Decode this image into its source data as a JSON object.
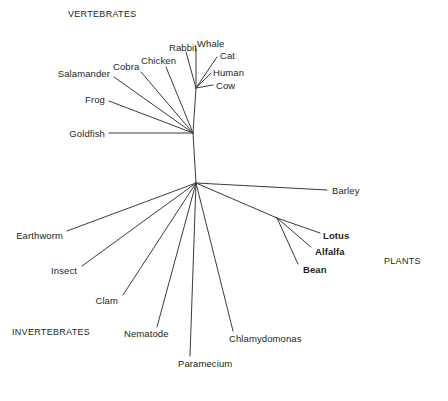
{
  "figure": {
    "name": "unrooted-phylogenetic-tree",
    "background_color": "#ffffff",
    "line_color": "#3b3b3b",
    "text_color": "#231f20",
    "width": 448,
    "height": 401
  },
  "group_labels": [
    {
      "id": "vertebrates",
      "text": "VERTEBRATES",
      "x": 68,
      "y": 14,
      "anchor": "left"
    },
    {
      "id": "invertebrates",
      "text": "INVERTEBRATES",
      "x": 12,
      "y": 332,
      "anchor": "left"
    },
    {
      "id": "plants",
      "text": "PLANTS",
      "x": 384,
      "y": 261,
      "anchor": "left"
    }
  ],
  "taxa": [
    {
      "id": "whale",
      "text": "Whale",
      "x": 197,
      "y": 43,
      "anchor": "left",
      "bold": false,
      "group": "vertebrates"
    },
    {
      "id": "cat",
      "text": "Cat",
      "x": 220,
      "y": 55,
      "anchor": "left",
      "bold": false,
      "group": "vertebrates"
    },
    {
      "id": "rabbit",
      "text": "Rabbit",
      "x": 169,
      "y": 47,
      "anchor": "left",
      "bold": false,
      "group": "vertebrates"
    },
    {
      "id": "human",
      "text": "Human",
      "x": 213,
      "y": 72,
      "anchor": "left",
      "bold": false,
      "group": "vertebrates"
    },
    {
      "id": "cow",
      "text": "Cow",
      "x": 216,
      "y": 85,
      "anchor": "left",
      "bold": false,
      "group": "vertebrates"
    },
    {
      "id": "chicken",
      "text": "Chicken",
      "x": 141,
      "y": 60,
      "anchor": "left",
      "bold": false,
      "group": "vertebrates"
    },
    {
      "id": "cobra",
      "text": "Cobra",
      "x": 113,
      "y": 66,
      "anchor": "left",
      "bold": false,
      "group": "vertebrates"
    },
    {
      "id": "salamander",
      "text": "Salamander",
      "x": 110,
      "y": 73,
      "anchor": "right",
      "bold": false,
      "group": "vertebrates"
    },
    {
      "id": "frog",
      "text": "Frog",
      "x": 105,
      "y": 99,
      "anchor": "right",
      "bold": false,
      "group": "vertebrates"
    },
    {
      "id": "goldfish",
      "text": "Goldfish",
      "x": 105,
      "y": 133,
      "anchor": "right",
      "bold": false,
      "group": "vertebrates"
    },
    {
      "id": "barley",
      "text": "Barley",
      "x": 332,
      "y": 190,
      "anchor": "left",
      "bold": false,
      "group": "plants"
    },
    {
      "id": "lotus",
      "text": "Lotus",
      "x": 323,
      "y": 235,
      "anchor": "left",
      "bold": true,
      "group": "plants"
    },
    {
      "id": "alfalfa",
      "text": "Alfalfa",
      "x": 315,
      "y": 251,
      "anchor": "left",
      "bold": true,
      "group": "plants"
    },
    {
      "id": "bean",
      "text": "Bean",
      "x": 303,
      "y": 269,
      "anchor": "left",
      "bold": true,
      "group": "plants"
    },
    {
      "id": "earthworm",
      "text": "Earthworm",
      "x": 63,
      "y": 235,
      "anchor": "right",
      "bold": false,
      "group": "invertebrates"
    },
    {
      "id": "insect",
      "text": "Insect",
      "x": 77,
      "y": 270,
      "anchor": "right",
      "bold": false,
      "group": "invertebrates"
    },
    {
      "id": "clam",
      "text": "Clam",
      "x": 118,
      "y": 300,
      "anchor": "right",
      "bold": false,
      "group": "invertebrates"
    },
    {
      "id": "nematode",
      "text": "Nematode",
      "x": 124,
      "y": 333,
      "anchor": "left",
      "bold": false,
      "group": "invertebrates"
    },
    {
      "id": "paramecium",
      "text": "Paramecium",
      "x": 178,
      "y": 363,
      "anchor": "left",
      "bold": false,
      "group": "other"
    },
    {
      "id": "chlamydomonas",
      "text": "Chlamydomonas",
      "x": 229,
      "y": 338,
      "anchor": "left",
      "bold": false,
      "group": "other"
    }
  ],
  "nodes": {
    "center": {
      "x": 196,
      "y": 183
    },
    "vertebrate": {
      "x": 193,
      "y": 133
    },
    "amniote": {
      "x": 196,
      "y": 88
    },
    "legume": {
      "x": 277,
      "y": 218
    }
  },
  "branches": [
    {
      "id": "center-to-vertebrate",
      "from": [
        196,
        183
      ],
      "to": [
        193,
        133
      ]
    },
    {
      "id": "vertebrate-to-amniote",
      "from": [
        193,
        133
      ],
      "to": [
        196,
        88
      ]
    },
    {
      "id": "amniote-to-whale",
      "from": [
        196,
        88
      ],
      "to": [
        196,
        48
      ]
    },
    {
      "id": "amniote-to-cat",
      "from": [
        196,
        88
      ],
      "to": [
        217,
        57
      ]
    },
    {
      "id": "amniote-to-rabbit",
      "from": [
        196,
        88
      ],
      "to": [
        186,
        52
      ]
    },
    {
      "id": "amniote-to-human",
      "from": [
        196,
        88
      ],
      "to": [
        211,
        73
      ]
    },
    {
      "id": "amniote-to-cow",
      "from": [
        196,
        88
      ],
      "to": [
        213,
        85
      ]
    },
    {
      "id": "vertebrate-to-chicken",
      "from": [
        193,
        133
      ],
      "to": [
        166,
        67
      ]
    },
    {
      "id": "vertebrate-to-cobra",
      "from": [
        193,
        133
      ],
      "to": [
        141,
        72
      ]
    },
    {
      "id": "vertebrate-to-salamander",
      "from": [
        193,
        133
      ],
      "to": [
        114,
        77
      ]
    },
    {
      "id": "vertebrate-to-frog",
      "from": [
        193,
        133
      ],
      "to": [
        109,
        101
      ]
    },
    {
      "id": "vertebrate-to-goldfish",
      "from": [
        193,
        133
      ],
      "to": [
        109,
        133
      ]
    },
    {
      "id": "center-to-barley",
      "from": [
        196,
        183
      ],
      "to": [
        327,
        190
      ]
    },
    {
      "id": "center-to-legume",
      "from": [
        196,
        183
      ],
      "to": [
        277,
        218
      ]
    },
    {
      "id": "legume-to-lotus",
      "from": [
        277,
        218
      ],
      "to": [
        320,
        233
      ]
    },
    {
      "id": "legume-to-alfalfa",
      "from": [
        277,
        218
      ],
      "to": [
        311,
        247
      ]
    },
    {
      "id": "legume-to-bean",
      "from": [
        277,
        218
      ],
      "to": [
        298,
        264
      ]
    },
    {
      "id": "center-to-earthworm",
      "from": [
        196,
        183
      ],
      "to": [
        67,
        231
      ]
    },
    {
      "id": "center-to-insect",
      "from": [
        196,
        183
      ],
      "to": [
        82,
        266
      ]
    },
    {
      "id": "center-to-clam",
      "from": [
        196,
        183
      ],
      "to": [
        123,
        295
      ]
    },
    {
      "id": "center-to-nematode",
      "from": [
        196,
        183
      ],
      "to": [
        157,
        327
      ]
    },
    {
      "id": "center-to-paramecium",
      "from": [
        196,
        183
      ],
      "to": [
        190,
        356
      ]
    },
    {
      "id": "center-to-chlamydomonas",
      "from": [
        196,
        183
      ],
      "to": [
        233,
        331
      ]
    }
  ],
  "chart_data": {
    "type": "diagram",
    "diagram_type": "unrooted phylogenetic tree",
    "title": "",
    "groups": [
      "VERTEBRATES",
      "INVERTEBRATES",
      "PLANTS"
    ],
    "leaves": [
      "Whale",
      "Cat",
      "Rabbit",
      "Human",
      "Cow",
      "Chicken",
      "Cobra",
      "Salamander",
      "Frog",
      "Goldfish",
      "Barley",
      "Lotus",
      "Alfalfa",
      "Bean",
      "Earthworm",
      "Insect",
      "Clam",
      "Nematode",
      "Paramecium",
      "Chlamydomonas"
    ],
    "internal_nodes": [
      "center",
      "vertebrate",
      "amniote",
      "legume"
    ],
    "emphasized_leaves": [
      "Lotus",
      "Alfalfa",
      "Bean"
    ],
    "legend": "none",
    "grid": false
  }
}
